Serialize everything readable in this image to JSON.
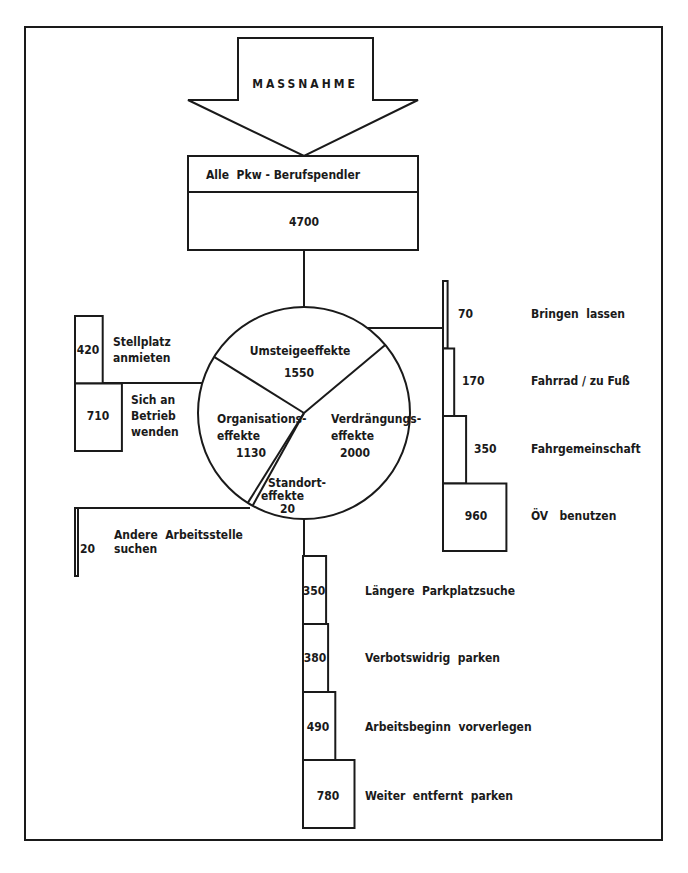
{
  "diagram": {
    "measure_label": "MASSNAHME",
    "root": {
      "label": "Alle  Pkw - Berufspendler",
      "value": "4700"
    },
    "pie": {
      "total": 4700,
      "segments": [
        {
          "name": "Umsteigeeffekte",
          "label_lines": [
            "Umsteigeeffekte"
          ],
          "value": 1550,
          "value_label": "1550"
        },
        {
          "name": "Verdrängungseffekte",
          "label_lines": [
            "Verdrängungs-",
            "effekte"
          ],
          "value": 2000,
          "value_label": "2000"
        },
        {
          "name": "Standorteffekte",
          "label_lines": [
            "Standort-",
            "effekte"
          ],
          "value": 20,
          "value_label": "20"
        },
        {
          "name": "Organisationseffekte",
          "label_lines": [
            "Organisations-",
            "effekte"
          ],
          "value": 1130,
          "value_label": "1130"
        }
      ]
    },
    "branches": {
      "umsteige": [
        {
          "value": 70,
          "value_label": "70",
          "label": "Bringen  lassen"
        },
        {
          "value": 170,
          "value_label": "170",
          "label": "Fahrrad / zu Fuß"
        },
        {
          "value": 350,
          "value_label": "350",
          "label": "Fahrgemeinschaft"
        },
        {
          "value": 960,
          "value_label": "960",
          "label": "ÖV   benutzen"
        }
      ],
      "organisation": [
        {
          "value": 420,
          "value_label": "420",
          "label_lines": [
            "Stellplatz",
            "anmieten"
          ]
        },
        {
          "value": 710,
          "value_label": "710",
          "label_lines": [
            "Sich an",
            "Betrieb",
            "wenden"
          ]
        }
      ],
      "standort": [
        {
          "value": 20,
          "value_label": "20",
          "label_lines": [
            "Andere  Arbeitsstelle",
            "suchen"
          ]
        }
      ],
      "verdraengung": [
        {
          "value": 350,
          "value_label": "350",
          "label": "Längere  Parkplatzsuche"
        },
        {
          "value": 380,
          "value_label": "380",
          "label": "Verbotswidrig  parken"
        },
        {
          "value": 490,
          "value_label": "490",
          "label": "Arbeitsbeginn  vorverlegen"
        },
        {
          "value": 780,
          "value_label": "780",
          "label": "Weiter  entfernt  parken"
        }
      ]
    }
  }
}
